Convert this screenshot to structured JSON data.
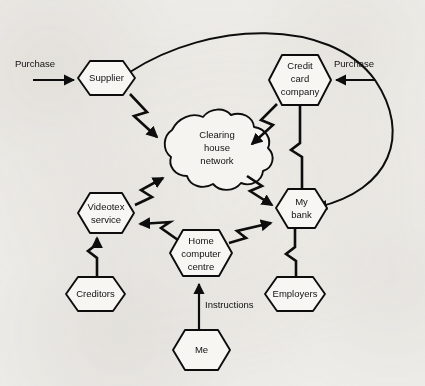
{
  "figure": {
    "background_color": "#f2f1ee",
    "ink_color": "#0d0d0d"
  },
  "nodes": {
    "supplier": {
      "label": "Supplier",
      "shape": "hexagon"
    },
    "credit_card_company": {
      "label": "Credit\ncard\ncompany",
      "line1": "Credit",
      "line2": "card",
      "line3": "company",
      "shape": "hexagon"
    },
    "clearing_house": {
      "label": "Clearing\nhouse\nnetwork",
      "line1": "Clearing",
      "line2": "house",
      "line3": "network",
      "shape": "cloud"
    },
    "videotex_service": {
      "label": "Videotex\nservice",
      "line1": "Videotex",
      "line2": "service",
      "shape": "hexagon"
    },
    "my_bank": {
      "label": "My\nbank",
      "line1": "My",
      "line2": "bank",
      "shape": "hexagon"
    },
    "home_computer_centre": {
      "label": "Home\ncomputer\ncentre",
      "line1": "Home",
      "line2": "computer",
      "line3": "centre",
      "shape": "hexagon"
    },
    "creditors": {
      "label": "Creditors",
      "shape": "hexagon"
    },
    "employers": {
      "label": "Employers",
      "shape": "hexagon"
    },
    "me": {
      "label": "Me",
      "shape": "hexagon"
    }
  },
  "edge_labels": {
    "purchase_left": "Purchase",
    "purchase_right": "Purchase",
    "instructions": "Instructions"
  },
  "edges": [
    {
      "from": "external",
      "to": "supplier",
      "style": "straight-arrow",
      "label": "Purchase"
    },
    {
      "from": "external",
      "to": "credit_card_company",
      "style": "straight-arrow",
      "label": "Purchase"
    },
    {
      "from": "supplier",
      "to": "clearing_house",
      "style": "lightning-arrow"
    },
    {
      "from": "credit_card_company",
      "to": "clearing_house",
      "style": "lightning-arrow"
    },
    {
      "from": "clearing_house",
      "to": "my_bank",
      "style": "lightning-arrow"
    },
    {
      "from": "videotex_service",
      "to": "clearing_house",
      "style": "lightning-arrow"
    },
    {
      "from": "home_computer_centre",
      "to": "videotex_service",
      "style": "lightning-arrow"
    },
    {
      "from": "home_computer_centre",
      "to": "my_bank",
      "style": "lightning-arrow"
    },
    {
      "from": "creditors",
      "to": "videotex_service",
      "style": "lightning-arrow"
    },
    {
      "from": "credit_card_company",
      "to": "my_bank",
      "style": "lightning-plain"
    },
    {
      "from": "my_bank",
      "to": "employers",
      "style": "lightning-plain"
    },
    {
      "from": "me",
      "to": "home_computer_centre",
      "style": "straight-arrow",
      "label": "Instructions"
    },
    {
      "from": "supplier",
      "to": "my_bank",
      "style": "curved-arc-arrow"
    }
  ]
}
